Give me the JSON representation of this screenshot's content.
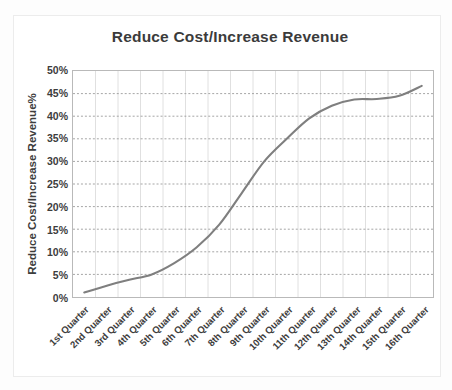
{
  "chart_data": {
    "type": "line",
    "title": "Reduce Cost/Increase Revenue",
    "xlabel": "",
    "ylabel": "Reduce Cost/Increase Revenue%",
    "ylim": [
      0,
      50
    ],
    "ytick_labels": [
      "50%",
      "45%",
      "40%",
      "35%",
      "30%",
      "25%",
      "20%",
      "15%",
      "10%",
      "5%",
      "0%"
    ],
    "ytick_values": [
      50,
      45,
      40,
      35,
      30,
      25,
      20,
      15,
      10,
      5,
      0
    ],
    "grid": "horizontal-dotted-and-vertical-solid",
    "legend": "none",
    "line_color": "#7f7f7f",
    "categories": [
      "1st Quarter",
      "2nd Quarter",
      "3rd Quarter",
      "4th Quarter",
      "5th Quarter",
      "6th Quarter",
      "7th Quarter",
      "8th Quarter",
      "9th Quarter",
      "10th Quarter",
      "11th Quarter",
      "12th Quarter",
      "13th Quarter",
      "14th Quarter",
      "15th Quarter",
      "16th Quarter"
    ],
    "values": [
      1,
      2.5,
      3.8,
      5,
      7.5,
      11,
      16,
      23,
      30,
      35,
      39.5,
      42.3,
      43.7,
      43.8,
      44.5,
      46.7
    ],
    "series": [
      {
        "name": "Reduce Cost/Increase Revenue%",
        "values": [
          1,
          2.5,
          3.8,
          5,
          7.5,
          11,
          16,
          23,
          30,
          35,
          39.5,
          42.3,
          43.7,
          43.8,
          44.5,
          46.7
        ]
      }
    ]
  }
}
